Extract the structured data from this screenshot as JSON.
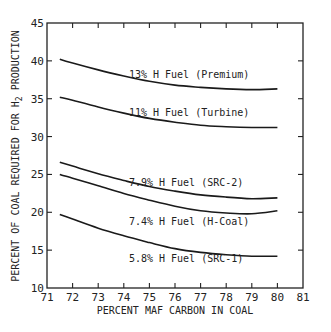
{
  "chart_data": {
    "type": "line",
    "title": "",
    "xlabel": "PERCENT MAF CARBON IN COAL",
    "ylabel": "PERCENT OF COAL REQUIRED FOR H2 PRODUCTION",
    "xlim": [
      71,
      81
    ],
    "ylim": [
      10,
      45
    ],
    "x_ticks": [
      71,
      72,
      73,
      74,
      75,
      76,
      77,
      78,
      79,
      80,
      81
    ],
    "y_ticks": [
      10,
      15,
      20,
      25,
      30,
      35,
      40,
      45
    ],
    "grid": false,
    "legend": "inline curve labels",
    "x": [
      71.5,
      72,
      73,
      74,
      75,
      76,
      77,
      78,
      79,
      80
    ],
    "series": [
      {
        "name": "13% H Fuel (Premium)",
        "values": [
          40.2,
          39.7,
          38.8,
          38.0,
          37.3,
          36.8,
          36.5,
          36.3,
          36.2,
          36.3
        ]
      },
      {
        "name": "11% H Fuel (Turbine)",
        "values": [
          35.2,
          34.8,
          33.9,
          33.1,
          32.4,
          31.9,
          31.5,
          31.3,
          31.2,
          31.2
        ]
      },
      {
        "name": "7.9% H Fuel (SRC-2)",
        "values": [
          26.6,
          26.1,
          25.1,
          24.2,
          23.4,
          22.8,
          22.3,
          22.0,
          21.8,
          21.9
        ]
      },
      {
        "name": "7.4% H Fuel (H-Coal)",
        "values": [
          25.0,
          24.5,
          23.5,
          22.5,
          21.6,
          20.8,
          20.2,
          19.9,
          19.8,
          20.2
        ]
      },
      {
        "name": "5.8% H Fuel (SRC-1)",
        "values": [
          19.7,
          19.1,
          17.9,
          16.9,
          16.0,
          15.2,
          14.7,
          14.4,
          14.2,
          14.2
        ]
      }
    ],
    "label_positions": [
      {
        "text": "13% H Fuel (Premium)",
        "x": 74.2,
        "y": 38.2
      },
      {
        "text": "11% H Fuel (Turbine)",
        "x": 74.2,
        "y": 33.2
      },
      {
        "text": "7.9% H Fuel (SRC-2)",
        "x": 74.2,
        "y": 24.0
      },
      {
        "text": "7.4% H Fuel (H-Coal)",
        "x": 74.2,
        "y": 18.9
      },
      {
        "text": "5.8% H Fuel (SRC-1)",
        "x": 74.2,
        "y": 13.9
      }
    ]
  }
}
